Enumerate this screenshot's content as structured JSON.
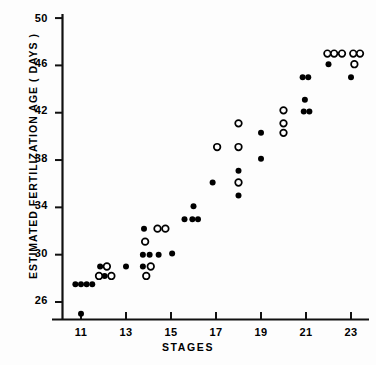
{
  "chart_data": {
    "type": "scatter",
    "title": "",
    "xlabel": "STAGES",
    "ylabel": "ESTIMATED FERTILIZATION AGE  ( DAYS )",
    "xlim": [
      10.0,
      23.8
    ],
    "ylim": [
      24.2,
      50.6
    ],
    "xticks": [
      11,
      13,
      15,
      17,
      19,
      21,
      23
    ],
    "xtick_labels": [
      "11",
      "13",
      "15",
      "17",
      "19",
      "21",
      "23"
    ],
    "yticks": [
      26,
      30,
      34,
      38,
      42,
      46,
      50
    ],
    "ytick_labels": [
      "26",
      "30",
      "34",
      "38",
      "42",
      "46",
      "50"
    ],
    "grid": false,
    "legend": null,
    "series": [
      {
        "name": "filled",
        "marker": "filled-circle",
        "color": "#000000",
        "points": [
          [
            10.75,
            27.5
          ],
          [
            11.0,
            27.5
          ],
          [
            11.25,
            27.5
          ],
          [
            11.5,
            27.5
          ],
          [
            11.0,
            25.0
          ],
          [
            11.85,
            29.0
          ],
          [
            12.05,
            28.2
          ],
          [
            13.0,
            29.0
          ],
          [
            13.8,
            32.2
          ],
          [
            13.75,
            29.0
          ],
          [
            13.75,
            30.0
          ],
          [
            14.05,
            30.0
          ],
          [
            14.45,
            30.0
          ],
          [
            15.05,
            30.1
          ],
          [
            15.6,
            33.0
          ],
          [
            15.95,
            33.0
          ],
          [
            16.2,
            33.0
          ],
          [
            16.0,
            34.1
          ],
          [
            16.85,
            36.1
          ],
          [
            18.0,
            37.1
          ],
          [
            18.0,
            36.1
          ],
          [
            18.0,
            35.0
          ],
          [
            19.0,
            40.3
          ],
          [
            19.0,
            38.1
          ],
          [
            20.85,
            45.0
          ],
          [
            21.1,
            45.0
          ],
          [
            20.95,
            43.1
          ],
          [
            20.9,
            42.1
          ],
          [
            21.15,
            42.1
          ],
          [
            22.0,
            46.1
          ],
          [
            23.0,
            45.0
          ]
        ]
      },
      {
        "name": "open",
        "marker": "open-circle",
        "color": "#000000",
        "points": [
          [
            11.8,
            28.2
          ],
          [
            12.35,
            28.2
          ],
          [
            12.15,
            29.0
          ],
          [
            13.85,
            31.1
          ],
          [
            13.9,
            28.2
          ],
          [
            14.1,
            29.0
          ],
          [
            14.4,
            32.2
          ],
          [
            14.75,
            32.2
          ],
          [
            17.05,
            39.1
          ],
          [
            18.0,
            41.1
          ],
          [
            18.0,
            39.1
          ],
          [
            18.0,
            36.1
          ],
          [
            20.0,
            42.2
          ],
          [
            20.0,
            41.1
          ],
          [
            20.0,
            40.3
          ],
          [
            21.95,
            47.0
          ],
          [
            22.25,
            47.0
          ],
          [
            22.6,
            47.0
          ],
          [
            23.1,
            47.0
          ],
          [
            23.4,
            47.0
          ],
          [
            23.15,
            46.1
          ]
        ]
      }
    ]
  },
  "axis": {
    "x_tick_0": "11",
    "x_tick_1": "13",
    "x_tick_2": "15",
    "x_tick_3": "17",
    "x_tick_4": "19",
    "x_tick_5": "21",
    "x_tick_6": "23",
    "y_tick_0": "26",
    "y_tick_1": "30",
    "y_tick_2": "34",
    "y_tick_3": "38",
    "y_tick_4": "42",
    "y_tick_5": "46",
    "y_tick_6": "50"
  },
  "labels": {
    "x_axis_title": "STAGES",
    "y_axis_title": "ESTIMATED FERTILIZATION AGE  ( DAYS )"
  }
}
